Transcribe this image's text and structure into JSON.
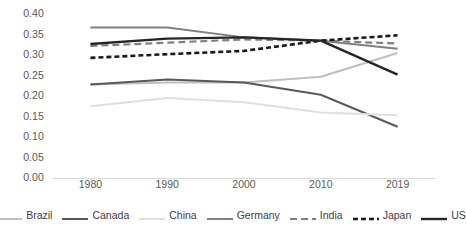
{
  "chart_data": {
    "type": "line",
    "title": "",
    "xlabel": "",
    "ylabel": "",
    "x": [
      1980,
      1990,
      2000,
      2010,
      2019
    ],
    "categories": [
      "1980",
      "1990",
      "2000",
      "2010",
      "2019"
    ],
    "ylim": [
      0.0,
      0.4
    ],
    "ytick_labels": [
      "0.00",
      "0.05",
      "0.10",
      "0.15",
      "0.20",
      "0.25",
      "0.30",
      "0.35",
      "0.40"
    ],
    "ytick_values": [
      0.0,
      0.05,
      0.1,
      0.15,
      0.2,
      0.25,
      0.3,
      0.35,
      0.4
    ],
    "grid": false,
    "legend_position": "bottom",
    "series": [
      {
        "name": "Brazil",
        "values": [
          0.228,
          0.233,
          0.233,
          0.247,
          0.305
        ],
        "color": "#bfbfbf",
        "style": "solid",
        "width": 2.0
      },
      {
        "name": "Canada",
        "values": [
          0.228,
          0.24,
          0.233,
          0.203,
          0.125
        ],
        "color": "#595959",
        "style": "solid",
        "width": 2.0
      },
      {
        "name": "China",
        "values": [
          0.175,
          0.195,
          0.185,
          0.16,
          0.153
        ],
        "color": "#e0e0e0",
        "style": "solid",
        "width": 2.0
      },
      {
        "name": "Germany",
        "values": [
          0.367,
          0.367,
          0.343,
          0.335,
          0.315
        ],
        "color": "#808080",
        "style": "solid",
        "width": 2.0
      },
      {
        "name": "India",
        "values": [
          0.322,
          0.33,
          0.338,
          0.335,
          0.328
        ],
        "color": "#808080",
        "style": "dashed",
        "width": 2.2
      },
      {
        "name": "Japan",
        "values": [
          0.293,
          0.302,
          0.31,
          0.335,
          0.348
        ],
        "color": "#1a1a1a",
        "style": "dotted",
        "width": 2.6
      },
      {
        "name": "US",
        "values": [
          0.327,
          0.34,
          0.343,
          0.335,
          0.252
        ],
        "color": "#262626",
        "style": "solid",
        "width": 2.4
      }
    ]
  },
  "legend": {
    "items": [
      {
        "label": "Brazil"
      },
      {
        "label": "Canada"
      },
      {
        "label": "China"
      },
      {
        "label": "Germany"
      },
      {
        "label": "India"
      },
      {
        "label": "Japan"
      },
      {
        "label": "US"
      }
    ]
  }
}
